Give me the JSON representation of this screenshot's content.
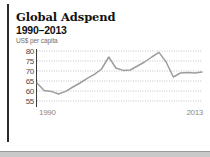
{
  "figure": {
    "title": "Global Adspend",
    "subtitle": "1990–2013",
    "unit_label": "US$ per capita"
  },
  "chart_data": {
    "type": "line",
    "title": "Global Adspend",
    "subtitle": "1990–2013",
    "xlabel": "",
    "ylabel": "US$ per capita",
    "ylim": [
      55,
      80
    ],
    "xlim": [
      1990,
      2013
    ],
    "grid": true,
    "legend": false,
    "yticks": [
      80,
      75,
      70,
      65,
      60,
      55
    ],
    "ytick_labels": [
      "80",
      "75",
      "70",
      "65",
      "60",
      "55"
    ],
    "xticks": [
      1990,
      2013
    ],
    "xtick_labels": [
      "1990",
      "2013"
    ],
    "x": [
      1990,
      1991,
      1992,
      1993,
      1994,
      1995,
      1996,
      1997,
      1998,
      1999,
      2000,
      2001,
      2002,
      2003,
      2004,
      2005,
      2006,
      2007,
      2008,
      2009,
      2010,
      2011,
      2012,
      2013
    ],
    "values": [
      64.0,
      60.3,
      59.8,
      58.5,
      59.8,
      62.0,
      64.0,
      66.3,
      68.3,
      71.0,
      77.0,
      71.5,
      70.3,
      70.5,
      72.5,
      74.5,
      77.0,
      79.3,
      74.5,
      67.0,
      69.0,
      69.3,
      69.0,
      69.5
    ],
    "series": [
      {
        "name": "Global adspend per capita",
        "color": "#9d9d9d",
        "values": [
          64.0,
          60.3,
          59.8,
          58.5,
          59.8,
          62.0,
          64.0,
          66.3,
          68.3,
          71.0,
          77.0,
          71.5,
          70.3,
          70.5,
          72.5,
          74.5,
          77.0,
          79.3,
          74.5,
          67.0,
          69.0,
          69.3,
          69.0,
          69.5
        ]
      }
    ]
  },
  "colors": {
    "line": "#9d9d9d",
    "grid": "#b4b4b4",
    "axis": "#3a3a3a",
    "title_text": "#111111",
    "unit_text": "#6e6e6e",
    "ytick_text": "#4a4a4a",
    "xtick_text": "#8a8a8a",
    "rule": "#2b2b2b",
    "band": "#c9c9c9",
    "background": "#ffffff"
  }
}
